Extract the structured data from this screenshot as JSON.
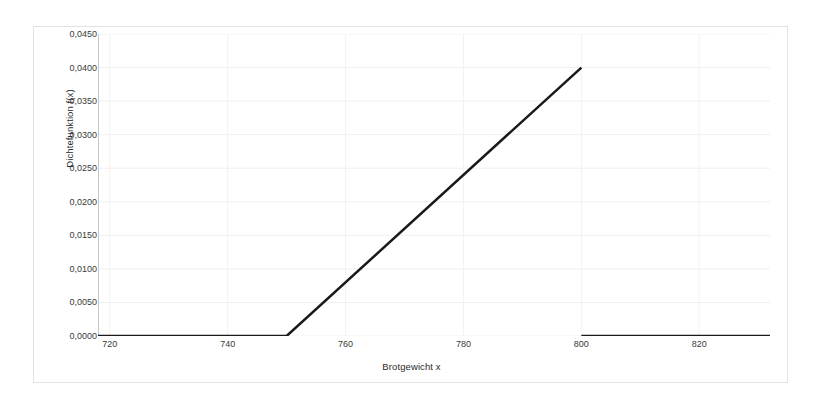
{
  "chart_data": {
    "type": "line",
    "title": "",
    "subtitle": "",
    "xlabel": "Brotgewicht x",
    "ylabel": "Dichtefunktion f(x)",
    "xlim": [
      718,
      832
    ],
    "ylim": [
      0.0,
      0.045
    ],
    "grid": true,
    "legend": null,
    "x_ticks": [
      720,
      740,
      760,
      780,
      800,
      820
    ],
    "x_tick_labels": [
      "720",
      "740",
      "760",
      "780",
      "800",
      "820"
    ],
    "y_ticks": [
      0.0,
      0.005,
      0.01,
      0.015,
      0.02,
      0.025,
      0.03,
      0.035,
      0.04,
      0.045
    ],
    "y_tick_labels": [
      "0,0000",
      "0,0050",
      "0,0100",
      "0,0150",
      "0,0200",
      "0,0250",
      "0,0300",
      "0,0350",
      "0,0400",
      "0,0450"
    ],
    "line_color": "#1a1a1a",
    "line_width": 2.5,
    "series": [
      {
        "name": "Dichtefunktion f(x)",
        "x": [
          718,
          750,
          800
        ],
        "values": [
          0.0,
          0.0,
          0.04
        ],
        "segment": "ramp"
      },
      {
        "name": "Dichtefunktion f(x) Nullbereich rechts",
        "x": [
          800,
          832
        ],
        "values": [
          0.0,
          0.0
        ],
        "segment": "zero-right"
      }
    ],
    "annotations": [
      "Dichte ist 0 fuer x < 750",
      "Linearer Anstieg von (750; 0,0000) bis (800; 0,0400)",
      "Sprung auf 0 bei x = 800, danach 0 bis x = 832"
    ]
  }
}
